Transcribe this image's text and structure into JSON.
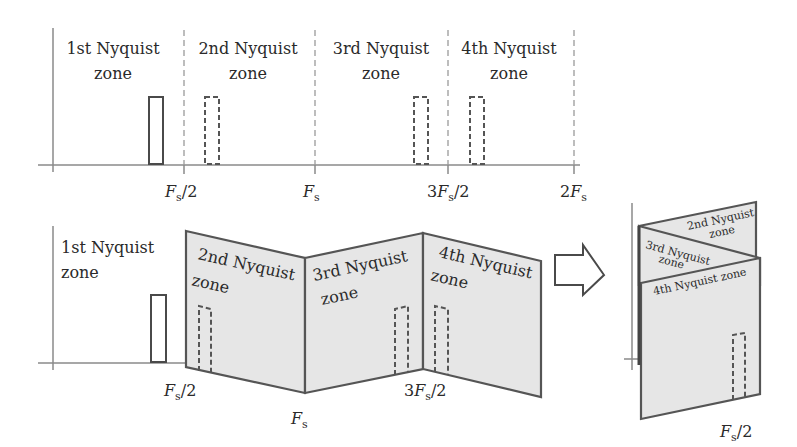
{
  "top_diagram": {
    "zones": [
      {
        "line1": "1st Nyquist",
        "line2": "zone"
      },
      {
        "line1": "2nd Nyquist",
        "line2": "zone"
      },
      {
        "line1": "3rd Nyquist",
        "line2": "zone"
      },
      {
        "line1": "4th Nyquist",
        "line2": "zone"
      }
    ],
    "tick_labels": [
      {
        "main": "F",
        "sub": "s",
        "suffix": "/2",
        "prefix": ""
      },
      {
        "main": "F",
        "sub": "s",
        "suffix": "",
        "prefix": ""
      },
      {
        "main": "F",
        "sub": "s",
        "suffix": "/2",
        "prefix": "3"
      },
      {
        "main": "F",
        "sub": "s",
        "suffix": "",
        "prefix": "2"
      }
    ],
    "signals": [
      {
        "type": "original",
        "style": "solid"
      },
      {
        "type": "alias",
        "style": "dashed"
      },
      {
        "type": "alias",
        "style": "dashed"
      },
      {
        "type": "alias",
        "style": "dashed"
      }
    ]
  },
  "folded_diagram": {
    "zone1": {
      "line1": "1st Nyquist",
      "line2": "zone"
    },
    "panels": [
      {
        "line1": "2nd Nyquist",
        "line2": "zone"
      },
      {
        "line1": "3rd Nyquist",
        "line2": "zone"
      },
      {
        "line1": "4th Nyquist",
        "line2": "zone"
      }
    ],
    "tick_labels": [
      {
        "main": "F",
        "sub": "s",
        "suffix": "/2",
        "prefix": ""
      },
      {
        "main": "F",
        "sub": "s",
        "suffix": "",
        "prefix": ""
      },
      {
        "main": "F",
        "sub": "s",
        "suffix": "/2",
        "prefix": "3"
      }
    ]
  },
  "arrow": {
    "icon": "right-arrow-icon"
  },
  "stacked_diagram": {
    "panels": [
      {
        "text": "2nd Nyquist",
        "text2": "zone"
      },
      {
        "text": "3rd Nyquist",
        "text2": "zone"
      },
      {
        "text": "4th Nyquist zone"
      }
    ],
    "tick_label": {
      "main": "F",
      "sub": "s",
      "suffix": "/2"
    }
  }
}
